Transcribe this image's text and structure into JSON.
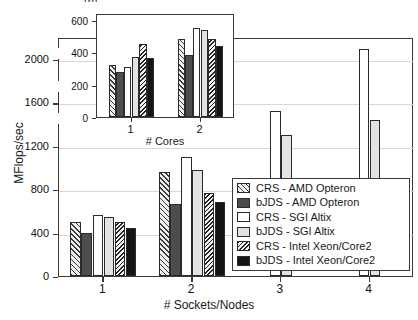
{
  "figure": {
    "caption_fragment": "(b)",
    "background": "#ffffff",
    "axis_color": "#3a3a3a",
    "grid_color": "#d8d8d8"
  },
  "chart_data": {
    "type": "bar",
    "title": "",
    "xlabel": "# Sockets/Nodes",
    "ylabel": "MFlops/sec",
    "categories": [
      "1",
      "2",
      "3",
      "4"
    ],
    "ylim": [
      0,
      2200
    ],
    "yticks": [
      0,
      400,
      800,
      1200,
      1600,
      2000
    ],
    "ytick_labels": [
      "0",
      "400",
      "800",
      "1200",
      "1600",
      "2000"
    ],
    "grid": true,
    "legend_position": "lower-right",
    "series": [
      {
        "name": "CRS - AMD Opteron",
        "fill": "f-crs-amd",
        "values": [
          500,
          955,
          null,
          null
        ]
      },
      {
        "name": "bJDS - AMD Opteron",
        "fill": "f-bjds-amd",
        "values": [
          395,
          665,
          null,
          null
        ]
      },
      {
        "name": "CRS - SGI Altix",
        "fill": "f-crs-sgi",
        "values": [
          560,
          1100,
          1520,
          2090
        ]
      },
      {
        "name": "bJDS - SGI Altix",
        "fill": "f-bjds-sgi",
        "values": [
          545,
          980,
          1300,
          1440
        ]
      },
      {
        "name": "CRS - Intel Xeon/Core2",
        "fill": "f-crs-intel",
        "values": [
          500,
          760,
          null,
          null
        ]
      },
      {
        "name": "bJDS - Intel Xeon/Core2",
        "fill": "f-bjds-intel",
        "values": [
          445,
          680,
          null,
          null
        ]
      }
    ]
  },
  "inset_chart_data": {
    "type": "bar",
    "title": "",
    "xlabel": "# Cores",
    "ylabel": "",
    "categories": [
      "1",
      "2"
    ],
    "ylim": [
      0,
      640
    ],
    "yticks": [
      0,
      200,
      400,
      600
    ],
    "ytick_labels": [
      "0",
      "200",
      "400",
      "600"
    ],
    "grid": false,
    "series": [
      {
        "name": "CRS - AMD Opteron",
        "fill": "f-crs-amd",
        "values": [
          320,
          480
        ]
      },
      {
        "name": "bJDS - AMD Opteron",
        "fill": "f-bjds-amd",
        "values": [
          275,
          380
        ]
      },
      {
        "name": "CRS - SGI Altix",
        "fill": "f-crs-sgi",
        "values": [
          310,
          550
        ]
      },
      {
        "name": "bJDS - SGI Altix",
        "fill": "f-bjds-sgi",
        "values": [
          370,
          535
        ]
      },
      {
        "name": "CRS - Intel Xeon/Core2",
        "fill": "f-crs-intel",
        "values": [
          450,
          480
        ]
      },
      {
        "name": "bJDS - Intel Xeon/Core2",
        "fill": "f-bjds-intel",
        "values": [
          365,
          435
        ]
      }
    ]
  },
  "legend": {
    "items": [
      {
        "label": "CRS - AMD Opteron",
        "fill": "f-crs-amd"
      },
      {
        "label": "bJDS - AMD Opteron",
        "fill": "f-bjds-amd"
      },
      {
        "label": "CRS - SGI Altix",
        "fill": "f-crs-sgi"
      },
      {
        "label": "bJDS - SGI Altix",
        "fill": "f-bjds-sgi"
      },
      {
        "label": "CRS - Intel Xeon/Core2",
        "fill": "f-crs-intel"
      },
      {
        "label": "bJDS - Intel Xeon/Core2",
        "fill": "f-bjds-intel"
      }
    ]
  }
}
